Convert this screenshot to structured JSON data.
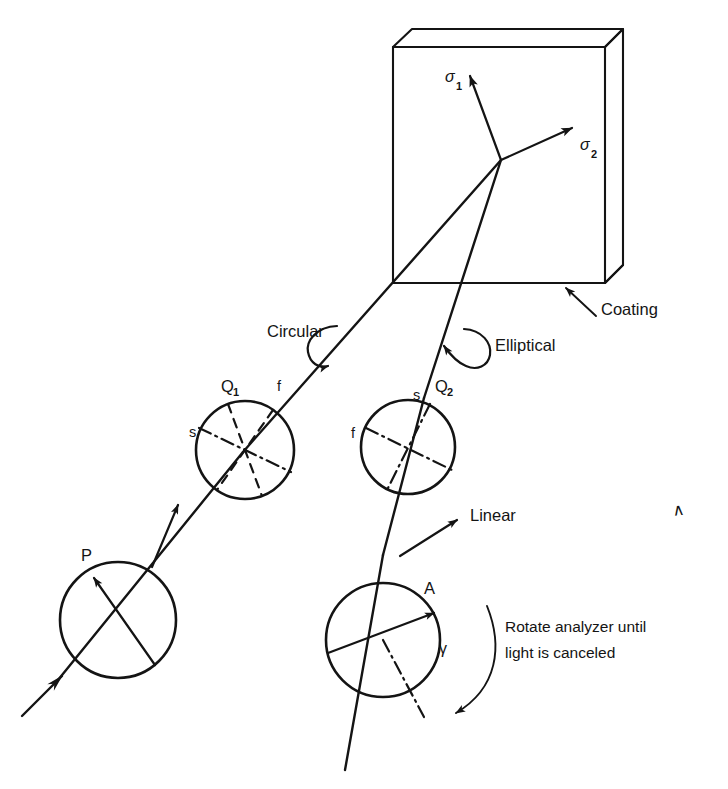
{
  "figure": {
    "background_color": "#ffffff",
    "ink_color": "#141414"
  },
  "specimen": {
    "name": "coated-specimen-block",
    "stress_axes": [
      {
        "id": "sigma1",
        "base": "σ",
        "sub": "1"
      },
      {
        "id": "sigma2",
        "base": "σ",
        "sub": "2"
      }
    ],
    "coating_label": "Coating"
  },
  "optics": {
    "polarizer": {
      "id": "P",
      "label": "P"
    },
    "quarter_wave_1": {
      "id": "Q1",
      "label": "Q",
      "sub": "1",
      "fast_axis_label": "f",
      "slow_axis_label": "s"
    },
    "quarter_wave_2": {
      "id": "Q2",
      "label": "Q",
      "sub": "2",
      "fast_axis_label": "f",
      "slow_axis_label": "s"
    },
    "analyzer": {
      "id": "A",
      "label": "A",
      "angle_symbol": "γ"
    }
  },
  "polarization_states": {
    "circular": "Circular",
    "elliptical": "Elliptical",
    "linear": "Linear"
  },
  "instruction": {
    "line1": "Rotate analyzer until",
    "line2": "light is canceled"
  },
  "artifacts": {
    "stray_caret": "∧"
  }
}
